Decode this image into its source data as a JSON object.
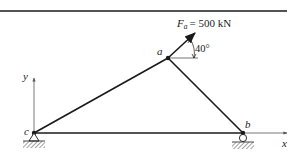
{
  "diagram": {
    "type": "truss",
    "nodes": {
      "a": {
        "label": "a",
        "x": 168,
        "y": 58
      },
      "b": {
        "label": "b",
        "x": 243,
        "y": 133
      },
      "c": {
        "label": "c",
        "x": 34,
        "y": 133
      }
    },
    "members": [
      {
        "from": "c",
        "to": "a"
      },
      {
        "from": "a",
        "to": "b"
      },
      {
        "from": "c",
        "to": "b"
      }
    ],
    "supports": [
      {
        "node": "c",
        "type": "pin"
      },
      {
        "node": "b",
        "type": "roller"
      }
    ],
    "force": {
      "node": "a",
      "symbol": "F",
      "subscript": "a",
      "equals_value": "= 500 kN",
      "angle_label": "40°",
      "angle_deg": 40
    },
    "axes": {
      "x_label": "x",
      "y_label": "y"
    }
  },
  "colors": {
    "stroke": "#1a1a1a",
    "axis": "#555555",
    "hatch": "#444444"
  }
}
